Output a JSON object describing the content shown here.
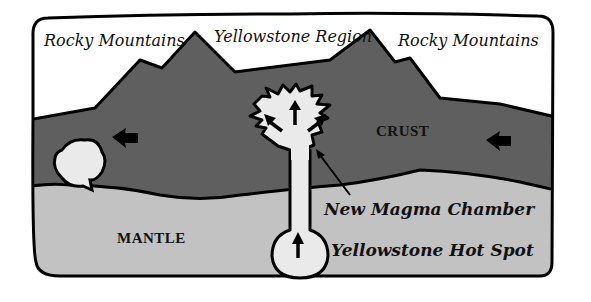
{
  "diagram": {
    "labels": {
      "rocky_left": "Rocky Mountains",
      "yellowstone_region": "Yellowstone Region",
      "rocky_right": "Rocky Mountains",
      "crust": "CRUST",
      "mantle": "MANTLE",
      "new_magma_chamber": "New Magma Chamber",
      "hot_spot": "Yellowstone Hot Spot"
    },
    "colors": {
      "sky": "#ffffff",
      "crust": "#5f5f5f",
      "mantle": "#c2c2c2",
      "magma": "#eaeaea",
      "outline": "#000000"
    }
  }
}
